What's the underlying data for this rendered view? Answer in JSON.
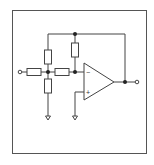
{
  "diagram": {
    "type": "op-amp circuit schematic",
    "frame": {
      "x": 12,
      "y": 10,
      "w": 134,
      "h": 143,
      "stroke": "#555555"
    },
    "stroke_color": "#444444",
    "opamp": {
      "inverting_label": "−",
      "noninverting_label": "+",
      "left_x": 84,
      "top_y": 63,
      "bottom_y": 100,
      "tip_x": 114,
      "tip_y": 82
    },
    "components": [
      {
        "name": "input-terminal",
        "kind": "terminal"
      },
      {
        "name": "resistor-input",
        "kind": "resistor"
      },
      {
        "name": "resistor-upper-tee",
        "kind": "resistor"
      },
      {
        "name": "resistor-lower-tee",
        "kind": "resistor"
      },
      {
        "name": "resistor-series",
        "kind": "resistor"
      },
      {
        "name": "resistor-feedback",
        "kind": "resistor"
      },
      {
        "name": "ground-tee",
        "kind": "ground"
      },
      {
        "name": "ground-noninverting",
        "kind": "ground"
      },
      {
        "name": "output-terminal",
        "kind": "terminal"
      }
    ]
  }
}
